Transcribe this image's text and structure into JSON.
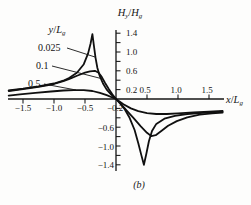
{
  "figure": {
    "caption": "(b)",
    "y_axis_title": {
      "v1": "H",
      "s1": "y",
      "sep": "/",
      "v2": "H",
      "s2": "g"
    },
    "x_axis_title": {
      "v1": "x",
      "sep": "/",
      "v2": "L",
      "s2": "g"
    },
    "family_label": {
      "v1": "y",
      "sep": "/",
      "v2": "L",
      "s2": "g"
    }
  },
  "axes": {
    "x_neg_labels": [
      "−1.5",
      "−1.0",
      "−0.5"
    ],
    "x_pos_labels": [
      "0.5",
      "1.0",
      "1.5"
    ],
    "y_pos_labels": [
      "1.4",
      "1.0",
      "0.6",
      "0.2"
    ],
    "y_neg_labels": [
      "−0.2",
      "−0.6",
      "−1.0",
      "−1.4"
    ]
  },
  "curve_labels": [
    "0.025",
    "0.1",
    "0.5"
  ],
  "chart_data": {
    "type": "line",
    "title": "",
    "xlabel": "x/Lg",
    "ylabel": "Hy/Hg",
    "xlim": [
      -1.75,
      1.85
    ],
    "ylim": [
      -1.5,
      1.5
    ],
    "grid": false,
    "legend_position": "annotated-on-plot",
    "x_ticks": [
      -1.5,
      -1.0,
      -0.5,
      0.5,
      1.0,
      1.5
    ],
    "y_tick_step": 0.2,
    "y_labeled_ticks": [
      1.4,
      1.0,
      0.6,
      0.2,
      -0.2,
      -0.6,
      -1.0,
      -1.4
    ],
    "series": [
      {
        "name": "y/Lg = 0.025",
        "points": [
          [
            -1.73,
            0.18
          ],
          [
            -1.5,
            0.22
          ],
          [
            -1.25,
            0.27
          ],
          [
            -1.0,
            0.33
          ],
          [
            -0.85,
            0.39
          ],
          [
            -0.75,
            0.45
          ],
          [
            -0.63,
            0.56
          ],
          [
            -0.52,
            0.74
          ],
          [
            -0.45,
            0.97
          ],
          [
            -0.41,
            1.18
          ],
          [
            -0.38,
            1.38
          ],
          [
            -0.355,
            1.12
          ],
          [
            -0.33,
            0.88
          ],
          [
            -0.3,
            0.66
          ],
          [
            -0.26,
            0.48
          ],
          [
            -0.21,
            0.33
          ],
          [
            -0.15,
            0.2
          ],
          [
            -0.08,
            0.1
          ],
          [
            0,
            0
          ],
          [
            0.07,
            -0.1
          ],
          [
            0.14,
            -0.22
          ],
          [
            0.22,
            -0.4
          ],
          [
            0.3,
            -0.66
          ],
          [
            0.36,
            -0.94
          ],
          [
            0.41,
            -1.2
          ],
          [
            0.45,
            -1.4
          ],
          [
            0.49,
            -1.16
          ],
          [
            0.53,
            -0.9
          ],
          [
            0.58,
            -0.68
          ],
          [
            0.65,
            -0.53
          ],
          [
            0.78,
            -0.42
          ],
          [
            0.95,
            -0.36
          ],
          [
            1.15,
            -0.32
          ],
          [
            1.4,
            -0.295
          ],
          [
            1.72,
            -0.27
          ]
        ]
      },
      {
        "name": "y/Lg = 0.1",
        "points": [
          [
            -1.73,
            0.17
          ],
          [
            -1.5,
            0.21
          ],
          [
            -1.25,
            0.26
          ],
          [
            -1.0,
            0.32
          ],
          [
            -0.85,
            0.38
          ],
          [
            -0.75,
            0.43
          ],
          [
            -0.62,
            0.5
          ],
          [
            -0.5,
            0.56
          ],
          [
            -0.42,
            0.59
          ],
          [
            -0.34,
            0.6
          ],
          [
            -0.28,
            0.56
          ],
          [
            -0.23,
            0.47
          ],
          [
            -0.18,
            0.35
          ],
          [
            -0.12,
            0.22
          ],
          [
            -0.06,
            0.1
          ],
          [
            0,
            0
          ],
          [
            0.08,
            -0.11
          ],
          [
            0.17,
            -0.24
          ],
          [
            0.28,
            -0.4
          ],
          [
            0.4,
            -0.58
          ],
          [
            0.5,
            -0.72
          ],
          [
            0.57,
            -0.79
          ],
          [
            0.64,
            -0.77
          ],
          [
            0.73,
            -0.68
          ],
          [
            0.84,
            -0.57
          ],
          [
            0.98,
            -0.47
          ],
          [
            1.15,
            -0.39
          ],
          [
            1.35,
            -0.335
          ],
          [
            1.55,
            -0.305
          ],
          [
            1.72,
            -0.29
          ]
        ]
      },
      {
        "name": "y/Lg = 0.5",
        "points": [
          [
            -1.73,
            0.07
          ],
          [
            -1.55,
            0.1
          ],
          [
            -1.3,
            0.13
          ],
          [
            -1.05,
            0.16
          ],
          [
            -0.85,
            0.18
          ],
          [
            -0.68,
            0.19
          ],
          [
            -0.52,
            0.19
          ],
          [
            -0.38,
            0.17
          ],
          [
            -0.26,
            0.13
          ],
          [
            -0.15,
            0.08
          ],
          [
            0,
            0
          ],
          [
            0.12,
            -0.11
          ],
          [
            0.24,
            -0.2
          ],
          [
            0.36,
            -0.26
          ],
          [
            0.5,
            -0.3
          ],
          [
            0.65,
            -0.32
          ],
          [
            0.82,
            -0.32
          ],
          [
            1.0,
            -0.305
          ],
          [
            1.25,
            -0.285
          ],
          [
            1.5,
            -0.268
          ],
          [
            1.72,
            -0.255
          ]
        ]
      }
    ]
  }
}
